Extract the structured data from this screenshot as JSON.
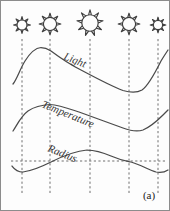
{
  "figure": {
    "panel_tag": "(a)",
    "background_color": "#fdfdfd",
    "border_color": "#8c8c8c",
    "curve_color": "#4a4a4a",
    "grid_color": "#6e6e6e",
    "icon_color": "#3d3d3d"
  },
  "icons": {
    "sun_name": "sun-icon",
    "sun_count": 5,
    "suns": [
      {
        "label": "sun-1",
        "cx": 21,
        "cy": 24,
        "radius": 5.0,
        "ray_length": 3.4,
        "rays": 8
      },
      {
        "label": "sun-2",
        "cx": 49,
        "cy": 23,
        "radius": 6.6,
        "ray_length": 4.2,
        "rays": 8
      },
      {
        "label": "sun-3",
        "cx": 89,
        "cy": 22,
        "radius": 8.2,
        "ray_length": 5.0,
        "rays": 9
      },
      {
        "label": "sun-4",
        "cx": 128,
        "cy": 23,
        "radius": 6.6,
        "ray_length": 4.2,
        "rays": 8
      },
      {
        "label": "sun-5",
        "cx": 157,
        "cy": 24,
        "radius": 4.6,
        "ray_length": 3.2,
        "rays": 8
      }
    ]
  },
  "grid": {
    "vertical_lines_x": [
      21,
      49,
      89,
      128,
      157
    ],
    "vertical_line_top": 38,
    "vertical_line_bottom": 192,
    "horizontal_line": {
      "y": 160,
      "x_start": 10,
      "x_end": 164
    }
  },
  "chart_data": {
    "type": "line",
    "title": "",
    "subtitle": "",
    "xlabel": "",
    "ylabel": "",
    "grid": true,
    "legend_position": "inline-along-curve",
    "annotations": [
      "(a)"
    ],
    "x_tick_labels": [],
    "y_tick_labels": [],
    "series": [
      {
        "name": "Light",
        "label": "Light",
        "label_rotation_deg": 22,
        "label_x": 62,
        "label_y": 58,
        "label_font_size": 11,
        "description": "Rises steeply, peaks near second gridline, declines steadily, shallow minimum past fourth gridline, then rises sharply at right edge",
        "x": [
          12,
          18,
          24,
          32,
          40,
          49,
          60,
          75,
          89,
          105,
          120,
          130,
          138,
          146,
          152,
          160,
          166
        ],
        "y": [
          82,
          72,
          60,
          50,
          47,
          49,
          54,
          62,
          70,
          78,
          86,
          90,
          91,
          88,
          80,
          65,
          52
        ],
        "path": "M 12 83 C 16 78 19 68 24 60 C 29 52 34 47 40 46.5 C 45 46.5 47 48 50 50 C 58 56 68 63 80 69 C 95 77 110 85 122 89.5 C 130 92 136 92 141 89 C 147 85 153 74 160 60 C 163 55 165 52 167 49"
      },
      {
        "name": "Temperature",
        "label": "Temperature",
        "label_rotation_deg": 22,
        "label_x": 40,
        "label_y": 106,
        "label_font_size": 11,
        "description": "Similar profile to Light but lower amplitude; rises, plateaus near second gridline, gentle decline, shallow dip past fourth gridline, then rises",
        "x": [
          12,
          18,
          26,
          36,
          49,
          62,
          78,
          95,
          112,
          126,
          136,
          146,
          156,
          166
        ],
        "y": [
          128,
          120,
          112,
          106,
          104,
          107,
          112,
          118,
          124,
          129,
          131,
          129,
          122,
          114
        ],
        "path": "M 12 130 C 16 124 20 115 27 110 C 33 106 40 104 49 103.5 C 58 104 66 107 78 111 C 92 116 108 122 122 127 C 130 130 136 131 142 129 C 149 126 156 120 162 114 C 164 112 166 110 167 109"
      },
      {
        "name": "Radius",
        "label": "Radius",
        "label_rotation_deg": 22,
        "label_x": 46,
        "label_y": 150,
        "label_font_size": 11,
        "description": "Smooth sinusoid oscillating about the horizontal dashed baseline; minimum near first gridline, maximum near third gridline, crosses baseline at second and fourth gridlines",
        "baseline_y": 160,
        "x": [
          12,
          21,
          35,
          49,
          65,
          80,
          89,
          100,
          115,
          128,
          142,
          155,
          166
        ],
        "y": [
          166,
          170,
          166,
          160,
          153,
          150,
          149,
          151,
          156,
          160,
          166,
          170,
          168
        ],
        "path": "M 11 165 C 14 169 17 171 22 171 C 30 170 40 166 50 161 C 62 155 74 150 86 149 C 94 149 101 151 110 155 C 119 159 125 160 130 161 C 140 164 148 169 155 171 C 160 172 164 171 167 169"
      }
    ]
  }
}
